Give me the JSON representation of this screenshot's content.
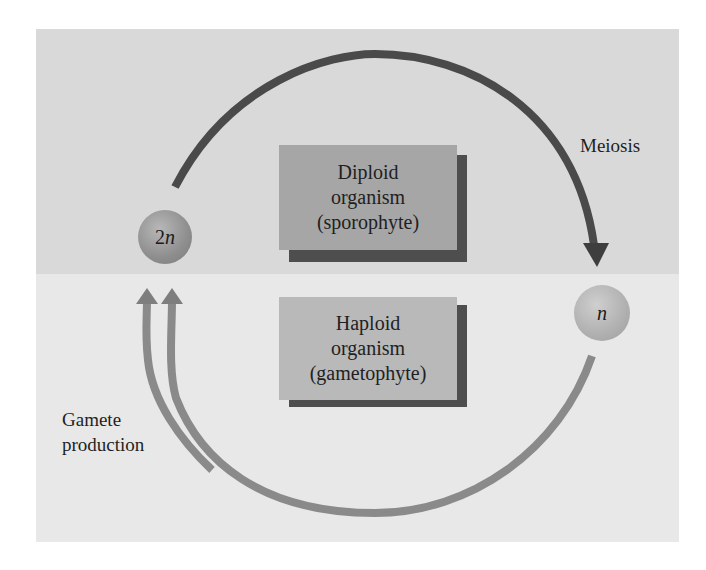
{
  "diagram": {
    "regions": [
      {
        "id": "diploid-phase",
        "color": "#d9d9d9"
      },
      {
        "id": "haploid-phase",
        "color": "#e8e8e8"
      }
    ],
    "boxes": {
      "diploid": {
        "line1": "Diploid",
        "line2": "organism",
        "line3": "(sporophyte)",
        "color": "#a6a6a6"
      },
      "haploid": {
        "line1": "Haploid",
        "line2": "organism",
        "line3": "(gametophyte)",
        "color": "#b9b9b9"
      }
    },
    "cells": {
      "diploid": {
        "num": "2",
        "var": "n"
      },
      "haploid": {
        "num": "",
        "var": "n"
      }
    },
    "labels": {
      "meiosis": "Meiosis",
      "gamete_line1": "Gamete",
      "gamete_line2": "production"
    },
    "arrows": [
      {
        "id": "meiosis-arrow",
        "from": "2n",
        "to": "n",
        "color": "#4a4a4a"
      },
      {
        "id": "gamete-arrow-1",
        "from": "n",
        "to": "2n",
        "color": "#8a8a8a"
      },
      {
        "id": "gamete-arrow-2",
        "from": "n",
        "to": "2n",
        "color": "#8a8a8a"
      }
    ]
  }
}
